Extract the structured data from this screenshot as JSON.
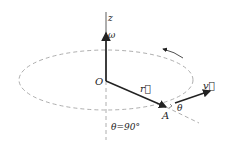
{
  "diagram": {
    "labels": {
      "z_axis": "z",
      "omega": "ω",
      "origin": "O",
      "r_vector": "r⃗",
      "point_a": "A",
      "theta": "θ",
      "v_vector": "v⃗",
      "angle_note": "θ=90°"
    },
    "colors": {
      "line": "#222222",
      "dashed": "#888888",
      "background": "#ffffff"
    }
  }
}
